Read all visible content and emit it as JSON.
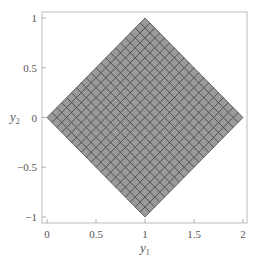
{
  "chart_data": {
    "type": "area",
    "title": "",
    "xlabel": "y1",
    "ylabel": "y2",
    "xlim": [
      0,
      2
    ],
    "ylim": [
      -1,
      1
    ],
    "xticks": [
      0,
      0.5,
      1,
      1.5,
      2
    ],
    "xtick_labels": [
      "0",
      "0.5",
      "1",
      "1.5",
      "2"
    ],
    "yticks": [
      -1,
      -0.5,
      0,
      0.5,
      1
    ],
    "ytick_labels": [
      "−1",
      "−0.5",
      "0",
      "0.5",
      "1"
    ],
    "grid": false,
    "legend": null,
    "shape": "diamond (rotated square) region |y2| <= 1 - |y1 - 1|, filled and meshed",
    "vertices": [
      [
        0,
        0
      ],
      [
        1,
        1
      ],
      [
        2,
        0
      ],
      [
        1,
        -1
      ]
    ],
    "mesh": {
      "divisions": 20,
      "orientation": "diagonal (parallel to diamond edges)"
    },
    "colors": {
      "fill": "#9a9a9a",
      "mesh_line": "#4a4a4a",
      "frame": "#bdbdbd",
      "text": "#555555"
    }
  },
  "axes": {
    "x_label_main": "y",
    "x_label_sub": "1",
    "y_label_main": "y",
    "y_label_sub": "2"
  }
}
